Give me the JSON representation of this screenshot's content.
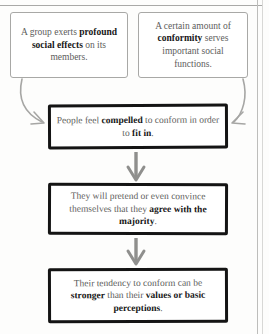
{
  "diagram": {
    "type": "flowchart",
    "orientation": "top-down",
    "premises": [
      {
        "id": "premise-1",
        "segments": [
          {
            "text": "A group exerts ",
            "bold": false
          },
          {
            "text": "profound social effects",
            "bold": true
          },
          {
            "text": " on its members.",
            "bold": false
          }
        ],
        "plain_text": "A group exerts profound social effects on its members."
      },
      {
        "id": "premise-2",
        "segments": [
          {
            "text": "A certain amount of ",
            "bold": false
          },
          {
            "text": "conformity",
            "bold": true
          },
          {
            "text": " serves important social functions.",
            "bold": false
          }
        ],
        "plain_text": "A certain amount of conformity serves important social functions."
      }
    ],
    "steps": [
      {
        "id": "step-1",
        "segments": [
          {
            "text": "People feel ",
            "bold": false
          },
          {
            "text": "compelled",
            "bold": true
          },
          {
            "text": " to conform in order to ",
            "bold": false
          },
          {
            "text": "fit in",
            "bold": true
          },
          {
            "text": ".",
            "bold": false
          }
        ],
        "plain_text": "People feel compelled to conform in order to fit in."
      },
      {
        "id": "step-2",
        "segments": [
          {
            "text": "They will pretend or even convince themselves that they ",
            "bold": false
          },
          {
            "text": "agree with the majority",
            "bold": true
          },
          {
            "text": ".",
            "bold": false
          }
        ],
        "plain_text": "They will pretend or even convince themselves that they agree with the majority."
      },
      {
        "id": "step-3",
        "segments": [
          {
            "text": "Their tendency to conform can be ",
            "bold": false
          },
          {
            "text": "stronger",
            "bold": true
          },
          {
            "text": " than their ",
            "bold": false
          },
          {
            "text": "values or basic perceptions",
            "bold": true
          },
          {
            "text": ".",
            "bold": false
          }
        ],
        "plain_text": "Their tendency to conform can be stronger than their values or basic perceptions."
      }
    ],
    "connectors": [
      {
        "id": "curve-left",
        "from": "premise-1",
        "to": "step-1",
        "style": "curved-arrow",
        "color": "#a6a6a4"
      },
      {
        "id": "curve-right",
        "from": "premise-2",
        "to": "step-1",
        "style": "curved-arrow",
        "color": "#a6a6a4"
      },
      {
        "id": "arrow-1",
        "from": "step-1",
        "to": "step-2",
        "style": "straight-down-arrow",
        "color": "#8f8f8d"
      },
      {
        "id": "arrow-2",
        "from": "step-2",
        "to": "step-3",
        "style": "straight-down-arrow",
        "color": "#8f8f8d"
      }
    ],
    "colors": {
      "body_text": "#5d5d5b",
      "emphasis_text": "#171717",
      "light_border": "#a8a8a6",
      "heavy_border": "#141414",
      "arrow_gray": "#9a9a98",
      "background": "#fdfdfc"
    }
  }
}
